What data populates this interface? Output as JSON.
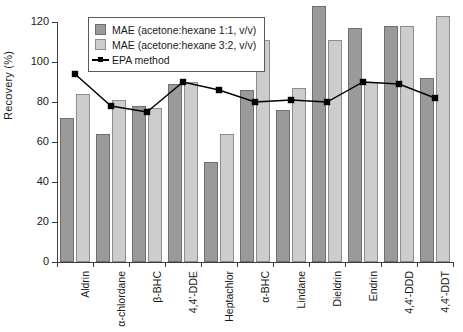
{
  "chart_data": {
    "type": "bar",
    "title": "",
    "xlabel": "",
    "ylabel": "Recovery (%)",
    "ylim": [
      0,
      120
    ],
    "yticks": [
      0,
      20,
      40,
      60,
      80,
      100,
      120
    ],
    "ytick_labels": [
      "0",
      "20",
      "40",
      "60",
      "80",
      "100",
      "120"
    ],
    "grid": false,
    "legend_position": "upper-left-inside",
    "categories": [
      "Aldrin",
      "α-chlordane",
      "β-BHC",
      "4,4'-DDE",
      "Heptachlor",
      "α-BHC",
      "Lindane",
      "Dieldrin",
      "Endrin",
      "4,4'-DDD",
      "4,4'-DDT"
    ],
    "series": [
      {
        "name": "MAE (acetone:hexane 1:1, v/v)",
        "type": "bar",
        "color": "#9a9a9a",
        "values": [
          72,
          64,
          78,
          89,
          50,
          86,
          76,
          128,
          117,
          118,
          92
        ]
      },
      {
        "name": "MAE (acetone:hexane 3:2, v/v)",
        "type": "bar",
        "color": "#cdcdcd",
        "values": [
          84,
          81,
          77,
          90,
          64,
          111,
          87,
          111,
          90,
          118,
          123
        ]
      },
      {
        "name": "EPA method",
        "type": "line",
        "color": "#000000",
        "values": [
          94,
          78,
          75,
          90,
          86,
          80,
          81,
          80,
          90,
          89,
          82
        ]
      }
    ]
  },
  "legend": {
    "items": [
      {
        "label": "MAE (acetone:hexane 1:1, v/v)",
        "marker": "swatch-dark"
      },
      {
        "label": "MAE (acetone:hexane 3:2, v/v)",
        "marker": "swatch-light"
      },
      {
        "label": "EPA method",
        "marker": "line-square"
      }
    ]
  }
}
